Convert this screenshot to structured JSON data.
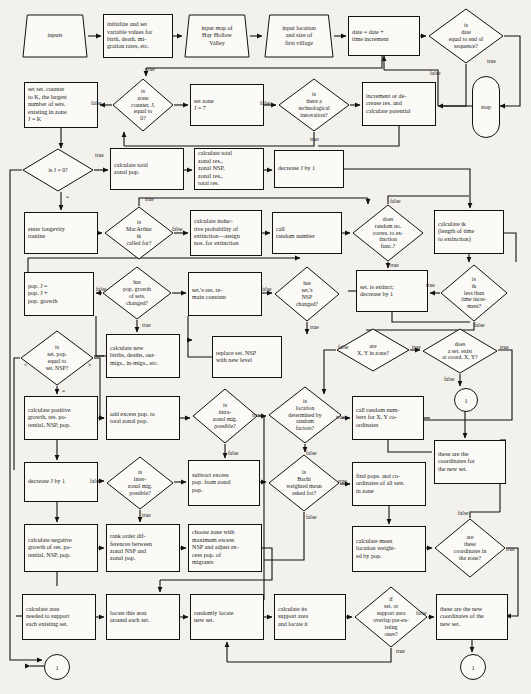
{
  "diagram": {
    "canvas": {
      "width": 531,
      "height": 694
    },
    "background": "#f3f1ec",
    "stroke": "#111111",
    "fill": "#fbfaf7"
  },
  "nodes": [
    {
      "id": "n1",
      "shape": "trapezoid",
      "name": "node-inputs",
      "x": 22,
      "y": 14,
      "w": 66,
      "h": 44,
      "text": "inputs"
    },
    {
      "id": "n2",
      "shape": "rect",
      "name": "node-initialize-variables",
      "x": 103,
      "y": 14,
      "w": 70,
      "h": 44,
      "text": "initialize and set\nvariable values for\nbirth, death, mi-\ngration rates, etc."
    },
    {
      "id": "n3",
      "shape": "trapezoid",
      "name": "node-input-map",
      "x": 184,
      "y": 14,
      "w": 66,
      "h": 44,
      "text": "input map of\nHay Hollow\nValley"
    },
    {
      "id": "n4",
      "shape": "trapezoid",
      "name": "node-input-location-size",
      "x": 264,
      "y": 14,
      "w": 70,
      "h": 44,
      "text": "input location\nand size of\nfirst village"
    },
    {
      "id": "n5",
      "shape": "rect",
      "name": "node-date-increment",
      "x": 348,
      "y": 16,
      "w": 72,
      "h": 40,
      "text": "date = date +\ntime increment"
    },
    {
      "id": "n6",
      "shape": "diamond",
      "name": "decision-date-end-of-sequence",
      "x": 428,
      "y": 8,
      "w": 76,
      "h": 56,
      "text": "is\ndate\nequal to end of\nsequence?"
    },
    {
      "id": "n7",
      "shape": "terminator",
      "name": "node-stop",
      "x": 472,
      "y": 76,
      "w": 26,
      "h": 60,
      "text": "stop"
    },
    {
      "id": "n8",
      "shape": "rect",
      "name": "node-set-settlement-counter",
      "x": 24,
      "y": 82,
      "w": 74,
      "h": 46,
      "text": "set set. counter\nto K, the largest\nnumber of sets.\nexisting in zone\nJ = K"
    },
    {
      "id": "n9",
      "shape": "diamond",
      "name": "decision-zone-counter-zero",
      "x": 112,
      "y": 78,
      "w": 62,
      "h": 54,
      "text": "is\nzone\ncounter, J,\nequal to\n0?"
    },
    {
      "id": "n10",
      "shape": "rect",
      "name": "node-set-zone",
      "x": 190,
      "y": 84,
      "w": 74,
      "h": 42,
      "text": "set zone\nJ = 7"
    },
    {
      "id": "n11",
      "shape": "diamond",
      "name": "decision-technological-innovation",
      "x": 278,
      "y": 78,
      "w": 72,
      "h": 54,
      "text": "is\nthere a\ntechnological\ninnovation?"
    },
    {
      "id": "n12",
      "shape": "rect",
      "name": "node-increment-decrease-res",
      "x": 362,
      "y": 82,
      "w": 74,
      "h": 44,
      "text": "increment or de-\ncrease res. and\ncalculate potential"
    },
    {
      "id": "n13",
      "shape": "diamond",
      "name": "decision-j-equals-zero",
      "x": 22,
      "y": 148,
      "w": 72,
      "h": 44,
      "text": "is J = 0?"
    },
    {
      "id": "n14",
      "shape": "rect",
      "name": "node-calculate-total-zonal-pop",
      "x": 110,
      "y": 148,
      "w": 74,
      "h": 42,
      "text": "calculate total\nzonal pop."
    },
    {
      "id": "n15",
      "shape": "rect",
      "name": "node-calculate-total-zonal-res",
      "x": 194,
      "y": 148,
      "w": 70,
      "h": 42,
      "text": "calculate total\nzonal res.,\nzonal NSP,\nzonal res.,\ntotal res."
    },
    {
      "id": "n16",
      "shape": "rect",
      "name": "node-decrease-j-by-1-top",
      "x": 274,
      "y": 150,
      "w": 70,
      "h": 38,
      "text": "decrease J by 1"
    },
    {
      "id": "n17",
      "shape": "rect",
      "name": "node-enter-longevity-routine",
      "x": 24,
      "y": 212,
      "w": 74,
      "h": 42,
      "text": "enter longevity\nroutine"
    },
    {
      "id": "n18",
      "shape": "diamond",
      "name": "decision-macarthur-tk",
      "x": 104,
      "y": 206,
      "w": 70,
      "h": 54,
      "text": "is\nMacArthur\ntk\ncalled for?"
    },
    {
      "id": "n19",
      "shape": "rect",
      "name": "node-inductive-probability-extinction",
      "x": 190,
      "y": 210,
      "w": 72,
      "h": 46,
      "text": "calculate induc-\ntive probability of\nextinction—assign\nnos. for extinction"
    },
    {
      "id": "n20",
      "shape": "rect",
      "name": "node-call-random-number",
      "x": 272,
      "y": 212,
      "w": 70,
      "h": 42,
      "text": "call\nrandom number"
    },
    {
      "id": "n21",
      "shape": "diamond",
      "name": "decision-random-no-extinction-func",
      "x": 352,
      "y": 204,
      "w": 72,
      "h": 58,
      "text": "does\nrandom no.\ncorres. to ex-\ntinction\nfunc.?"
    },
    {
      "id": "n22",
      "shape": "rect",
      "name": "node-calculate-tk-length",
      "x": 434,
      "y": 210,
      "w": 70,
      "h": 44,
      "text": "calculate tk\n(length of time\nto extinction)"
    },
    {
      "id": "n23",
      "shape": "rect",
      "name": "node-pop-growth-sum",
      "x": 24,
      "y": 272,
      "w": 70,
      "h": 44,
      "text": "pop. J =\npop. J +\npop. growth"
    },
    {
      "id": "n24",
      "shape": "diamond",
      "name": "decision-pop-growth-changed",
      "x": 102,
      "y": 266,
      "w": 70,
      "h": 54,
      "text": "has\npop. growth\nof sets.\nchanged?"
    },
    {
      "id": "n25",
      "shape": "rect",
      "name": "node-res-remain-constant",
      "x": 188,
      "y": 272,
      "w": 74,
      "h": 44,
      "text": "set.'s res. re-\nmain constant"
    },
    {
      "id": "n26",
      "shape": "diamond",
      "name": "decision-set-nsp-changed",
      "x": 274,
      "y": 266,
      "w": 66,
      "h": 56,
      "text": "has\nset.'s\nNSP\nchanged?"
    },
    {
      "id": "n27",
      "shape": "rect",
      "name": "node-set-is-extinct",
      "x": 356,
      "y": 270,
      "w": 72,
      "h": 42,
      "text": "set. is extinct;\ndecrease by 1"
    },
    {
      "id": "n28",
      "shape": "diamond",
      "name": "decision-tk-less-than-time-increment",
      "x": 440,
      "y": 264,
      "w": 68,
      "h": 58,
      "text": "is\ntk\nless than\ntime incre-\nment?"
    },
    {
      "id": "n29",
      "shape": "diamond",
      "name": "decision-set-pop-equal-nsp",
      "x": 20,
      "y": 330,
      "w": 74,
      "h": 56,
      "text": "is\nset. pop.\nequal to\nset. NSP?"
    },
    {
      "id": "n30",
      "shape": "rect",
      "name": "node-calculate-new-births-deaths",
      "x": 106,
      "y": 334,
      "w": 74,
      "h": 44,
      "text": "calculate new\nbirths, deaths, out-\nmigs., in-migs., etc."
    },
    {
      "id": "n31",
      "shape": "rect",
      "name": "node-replace-nsp-new-level",
      "x": 212,
      "y": 336,
      "w": 70,
      "h": 42,
      "text": "replace set. NSP\nwith new level"
    },
    {
      "id": "n32",
      "shape": "diamond",
      "name": "decision-xy-in-zone",
      "x": 336,
      "y": 328,
      "w": 74,
      "h": 44,
      "text": "are\nX, Y in zone?"
    },
    {
      "id": "n33",
      "shape": "diamond",
      "name": "decision-set-exist-at-coord",
      "x": 422,
      "y": 328,
      "w": 76,
      "h": 46,
      "text": "does\na set. exist\nat coord. X, Y?"
    },
    {
      "id": "n34",
      "shape": "rect",
      "name": "node-calculate-positive-growth",
      "x": 24,
      "y": 396,
      "w": 74,
      "h": 44,
      "text": "calculate positive\ngrowth, res. po-\ntential, NSP, pop."
    },
    {
      "id": "n35",
      "shape": "rect",
      "name": "node-add-excess-pop",
      "x": 106,
      "y": 396,
      "w": 74,
      "h": 44,
      "text": "add excess pop. to\ntotal zonal pop."
    },
    {
      "id": "n36",
      "shape": "diamond",
      "name": "decision-intrazonal-mig-possible",
      "x": 192,
      "y": 388,
      "w": 66,
      "h": 56,
      "text": "is\nintra-\nzonal mig.\npossible?"
    },
    {
      "id": "n37",
      "shape": "diamond",
      "name": "decision-location-random-factors",
      "x": 268,
      "y": 386,
      "w": 74,
      "h": 58,
      "text": "is\nlocation\ndetermined by\nrandom\nfactors?"
    },
    {
      "id": "n38",
      "shape": "rect",
      "name": "node-call-random-numbers-xy",
      "x": 352,
      "y": 396,
      "w": 72,
      "h": 44,
      "text": "call random num-\nbers for X, Y co-\nordinates"
    },
    {
      "id": "n39",
      "shape": "conn",
      "name": "connector-1-right-mid",
      "x": 454,
      "y": 388,
      "w": 22,
      "h": 22,
      "text": "1"
    },
    {
      "id": "n40",
      "shape": "rect",
      "name": "node-these-are-coordinates-new-set",
      "x": 434,
      "y": 440,
      "w": 72,
      "h": 44,
      "text": "these are the\ncoordinates for\nthe new set."
    },
    {
      "id": "n41",
      "shape": "rect",
      "name": "node-decrease-j-by-1-lower",
      "x": 24,
      "y": 462,
      "w": 74,
      "h": 40,
      "text": "decrease J by 1"
    },
    {
      "id": "n42",
      "shape": "diamond",
      "name": "decision-interzonal-mig-possible",
      "x": 106,
      "y": 456,
      "w": 68,
      "h": 54,
      "text": "is\ninter-\nzonal mig.\npossible?"
    },
    {
      "id": "n43",
      "shape": "rect",
      "name": "node-subtract-excess-pop",
      "x": 188,
      "y": 460,
      "w": 72,
      "h": 46,
      "text": "subtract excess\npop. from zonal\npop."
    },
    {
      "id": "n44",
      "shape": "diamond",
      "name": "decision-bachi-weighted-mean",
      "x": 268,
      "y": 454,
      "w": 72,
      "h": 58,
      "text": "is\nBachi\nweighted mean\nasked for?"
    },
    {
      "id": "n45",
      "shape": "rect",
      "name": "node-find-pops-coordinates",
      "x": 352,
      "y": 462,
      "w": 74,
      "h": 44,
      "text": "find pops. and co-\nordinates of all sets.\nin zone"
    },
    {
      "id": "n46",
      "shape": "rect",
      "name": "node-calculate-negative-growth",
      "x": 24,
      "y": 524,
      "w": 74,
      "h": 48,
      "text": "calculate negative\ngrowth of res. po-\ntential, NSP, pop."
    },
    {
      "id": "n47",
      "shape": "rect",
      "name": "node-rank-order-differences",
      "x": 106,
      "y": 524,
      "w": 74,
      "h": 48,
      "text": "rank order dif-\nferences between\nzonal NSP and\nzonal pop."
    },
    {
      "id": "n48",
      "shape": "rect",
      "name": "node-choose-zone-max-excess",
      "x": 188,
      "y": 524,
      "w": 74,
      "h": 48,
      "text": "choose zone with\nmaximum excess\nNSP and adjust ex-\ncess pop. of\nmigrants"
    },
    {
      "id": "n49",
      "shape": "rect",
      "name": "node-calculate-mean-location",
      "x": 352,
      "y": 526,
      "w": 74,
      "h": 46,
      "text": "calculate mean\nlocation weight-\ned by pop."
    },
    {
      "id": "n50",
      "shape": "diamond",
      "name": "decision-coordinates-in-zone",
      "x": 434,
      "y": 518,
      "w": 72,
      "h": 60,
      "text": "are\nthese\ncoordinates in\nthe zone?"
    },
    {
      "id": "n51",
      "shape": "rect",
      "name": "node-calculate-area-needed",
      "x": 22,
      "y": 594,
      "w": 74,
      "h": 46,
      "text": "calculate area\nneeded to support\neach existing set."
    },
    {
      "id": "n52",
      "shape": "rect",
      "name": "node-locate-area-around-set",
      "x": 106,
      "y": 594,
      "w": 74,
      "h": 46,
      "text": "locate this area\naround each set."
    },
    {
      "id": "n53",
      "shape": "rect",
      "name": "node-randomly-locate-new-set",
      "x": 190,
      "y": 594,
      "w": 74,
      "h": 46,
      "text": "randomly locate\nnew set."
    },
    {
      "id": "n54",
      "shape": "rect",
      "name": "node-calculate-support-area",
      "x": 274,
      "y": 594,
      "w": 72,
      "h": 46,
      "text": "calculate its\nsupport area\nand locate it"
    },
    {
      "id": "n55",
      "shape": "diamond",
      "name": "decision-overlap-pre-existing",
      "x": 354,
      "y": 586,
      "w": 74,
      "h": 62,
      "text": "if\nset. or\nsupport area\noverlap pre-ex-\nisting\nones?"
    },
    {
      "id": "n56",
      "shape": "rect",
      "name": "node-these-are-new-coordinates",
      "x": 436,
      "y": 594,
      "w": 72,
      "h": 46,
      "text": "these are the new\ncoordinates of the\nnew set."
    },
    {
      "id": "n57",
      "shape": "conn",
      "name": "connector-1-bottom-left",
      "x": 44,
      "y": 654,
      "w": 24,
      "h": 24,
      "text": "1"
    },
    {
      "id": "n58",
      "shape": "conn",
      "name": "connector-1-bottom-right",
      "x": 460,
      "y": 654,
      "w": 24,
      "h": 24,
      "text": "1"
    }
  ],
  "edge_labels": [
    {
      "name": "edge-label-true-date-end",
      "text": "true",
      "x": 487,
      "y": 58
    },
    {
      "name": "edge-label-false-date-end",
      "text": "false",
      "x": 430,
      "y": 70
    },
    {
      "name": "edge-label-true-zone-counter",
      "text": "true",
      "x": 146,
      "y": 66
    },
    {
      "name": "edge-label-false-zone-counter",
      "text": "false",
      "x": 91,
      "y": 100
    },
    {
      "name": "edge-label-false-tech-innov",
      "text": "false",
      "x": 260,
      "y": 100
    },
    {
      "name": "edge-label-true-tech-innov",
      "text": "true",
      "x": 310,
      "y": 136
    },
    {
      "name": "edge-label-true-j-zero",
      "text": "true",
      "x": 95,
      "y": 152
    },
    {
      "name": "edge-label-eq-j-zero",
      "text": "=",
      "x": 66,
      "y": 194
    },
    {
      "name": "edge-label-true-macarthur",
      "text": "true",
      "x": 145,
      "y": 196
    },
    {
      "name": "edge-label-false-macarthur",
      "text": "false",
      "x": 172,
      "y": 226
    },
    {
      "name": "edge-label-false-random-no",
      "text": "false",
      "x": 390,
      "y": 198
    },
    {
      "name": "edge-label-true-random-no",
      "text": "true",
      "x": 390,
      "y": 262
    },
    {
      "name": "edge-label-false-pop-growth",
      "text": "false",
      "x": 96,
      "y": 286
    },
    {
      "name": "edge-label-true-pop-growth",
      "text": "true",
      "x": 142,
      "y": 322
    },
    {
      "name": "edge-label-false-nsp-changed",
      "text": "false",
      "x": 261,
      "y": 286
    },
    {
      "name": "edge-label-true-nsp-changed",
      "text": "true",
      "x": 310,
      "y": 324
    },
    {
      "name": "edge-label-true-tk-less",
      "text": "true",
      "x": 426,
      "y": 282
    },
    {
      "name": "edge-label-false-tk-less",
      "text": "false",
      "x": 474,
      "y": 322
    },
    {
      "name": "edge-label-lt-set-pop",
      "text": "<",
      "x": 24,
      "y": 362
    },
    {
      "name": "edge-label-gt-set-pop",
      "text": ">",
      "x": 88,
      "y": 362
    },
    {
      "name": "edge-label-eq-set-pop",
      "text": "=",
      "x": 62,
      "y": 388
    },
    {
      "name": "edge-label-false-xy-zone",
      "text": "false",
      "x": 338,
      "y": 344
    },
    {
      "name": "edge-label-true-xy-zone",
      "text": "true",
      "x": 412,
      "y": 344
    },
    {
      "name": "edge-label-true-set-exist",
      "text": "true",
      "x": 500,
      "y": 344
    },
    {
      "name": "edge-label-false-set-exist",
      "text": "false",
      "x": 444,
      "y": 376
    },
    {
      "name": "edge-label-true-intrazonal",
      "text": "true",
      "x": 252,
      "y": 412
    },
    {
      "name": "edge-label-false-intrazonal",
      "text": "false",
      "x": 228,
      "y": 450
    },
    {
      "name": "edge-label-true-location-random",
      "text": "true",
      "x": 336,
      "y": 414
    },
    {
      "name": "edge-label-false-location-random",
      "text": "false",
      "x": 306,
      "y": 450
    },
    {
      "name": "edge-label-false-interzonal",
      "text": "false",
      "x": 90,
      "y": 478
    },
    {
      "name": "edge-label-true-interzonal",
      "text": "true",
      "x": 142,
      "y": 512
    },
    {
      "name": "edge-label-true-bachi",
      "text": "true",
      "x": 338,
      "y": 478
    },
    {
      "name": "edge-label-false-bachi",
      "text": "false",
      "x": 306,
      "y": 514
    },
    {
      "name": "edge-label-false-coord-zone",
      "text": "false",
      "x": 458,
      "y": 510
    },
    {
      "name": "edge-label-true-coord-zone",
      "text": "true",
      "x": 506,
      "y": 546
    },
    {
      "name": "edge-label-false-overlap",
      "text": "false",
      "x": 416,
      "y": 610
    },
    {
      "name": "edge-label-true-overlap",
      "text": "true",
      "x": 396,
      "y": 648
    }
  ]
}
